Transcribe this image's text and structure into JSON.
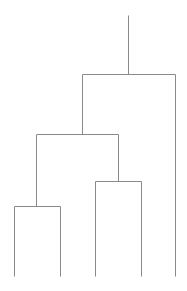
{
  "diagram": {
    "type": "dendrogram",
    "line_color": "#8a8a8a",
    "line_width": 1,
    "leaves": [
      {
        "id": "leaf-1",
        "x": 14
      },
      {
        "id": "leaf-2",
        "x": 60
      },
      {
        "id": "leaf-3",
        "x": 95
      },
      {
        "id": "leaf-4",
        "x": 141
      },
      {
        "id": "leaf-5",
        "x": 175
      }
    ],
    "leaf_bottom_y": 276,
    "merges": [
      {
        "id": "merge-a",
        "left_x": 14,
        "right_x": 60,
        "y": 206,
        "center_x": 36,
        "parent_y": 134
      },
      {
        "id": "merge-b",
        "left_x": 95,
        "right_x": 141,
        "y": 181,
        "center_x": 118,
        "parent_y": 134
      },
      {
        "id": "merge-c",
        "left_x": 36,
        "right_x": 118,
        "y": 134,
        "center_x": 82,
        "parent_y": 74
      },
      {
        "id": "merge-root",
        "left_x": 82,
        "right_x": 175,
        "y": 74,
        "center_x": 128,
        "parent_y": 15
      }
    ]
  }
}
